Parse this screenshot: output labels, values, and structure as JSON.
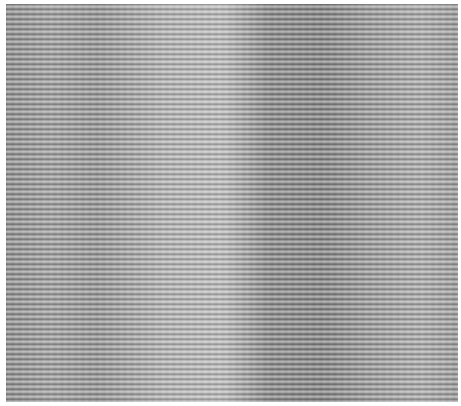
{
  "image": {
    "description": "Grayscale horizontal-striped fabric/corduroy texture with vertical light and dark bands",
    "colors": {
      "dark_band": "#838383",
      "light_band": "#bdbdbd",
      "mid": "#9a9a9a",
      "background": "#ffffff"
    }
  }
}
